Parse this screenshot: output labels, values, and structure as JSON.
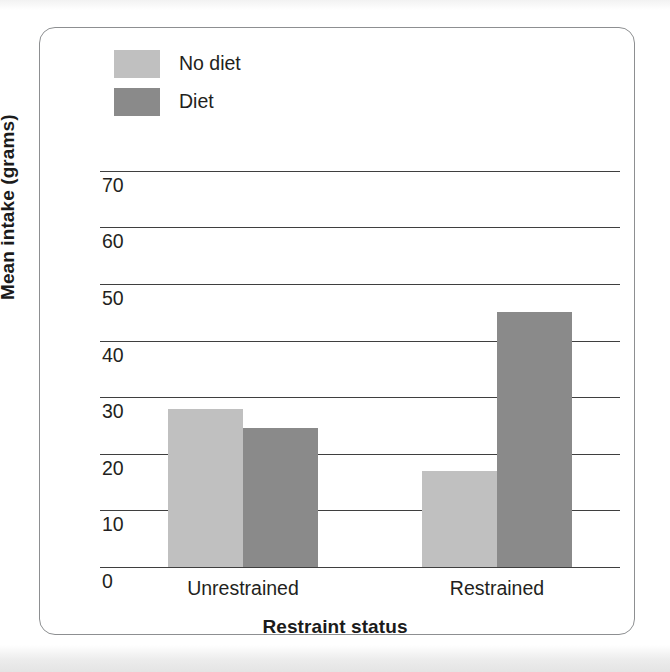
{
  "chart_data": {
    "type": "bar",
    "title": "",
    "subtitle": "",
    "xlabel": "Restraint status",
    "ylabel": "Mean intake (grams)",
    "categories": [
      "Unrestrained",
      "Restrained"
    ],
    "series": [
      {
        "name": "No diet",
        "color": "#c0c0c0",
        "values": [
          28,
          17
        ]
      },
      {
        "name": "Diet",
        "color": "#8a8a8a",
        "values": [
          24.5,
          45
        ]
      }
    ],
    "ylim": [
      0,
      75
    ],
    "yticks": [
      0,
      10,
      20,
      30,
      40,
      50,
      60,
      70
    ],
    "ytick_labels": [
      "0",
      "10",
      "20",
      "30",
      "40",
      "50",
      "60",
      "70"
    ],
    "grid": "horizontal",
    "legend_position": "top-left"
  },
  "legend": {
    "items": [
      {
        "label": "No diet",
        "color": "#c0c0c0"
      },
      {
        "label": "Diet",
        "color": "#8a8a8a"
      }
    ]
  },
  "axes": {
    "y_title": "Mean intake (grams)",
    "x_title": "Restraint status",
    "y_ticks": [
      "70",
      "60",
      "50",
      "40",
      "30",
      "20",
      "10",
      "0"
    ],
    "x_ticks": [
      "Unrestrained",
      "Restrained"
    ]
  },
  "colors": {
    "no_diet": "#c0c0c0",
    "diet": "#8a8a8a",
    "axis": "#3f3f3f",
    "frame": "#8d8f91",
    "text": "#231f20"
  }
}
